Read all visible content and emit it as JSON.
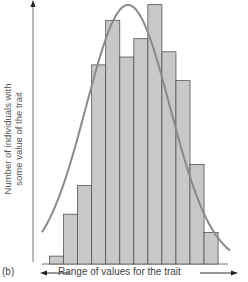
{
  "chart_data": {
    "type": "bar",
    "title": "",
    "panel_label": "(b)",
    "xlabel": "Range of values for the trait",
    "ylabel_line1": "Number of individuals with",
    "ylabel_line2": "some value of the trait",
    "categories": [
      "1",
      "2",
      "3",
      "4",
      "5",
      "6",
      "7",
      "8",
      "9",
      "10",
      "11",
      "12"
    ],
    "values": [
      3,
      19,
      30,
      76,
      93,
      79,
      86,
      99,
      81,
      70,
      38,
      12
    ],
    "ylim": [
      0,
      100
    ],
    "grid": false,
    "legend": null,
    "overlay": "normal distribution curve",
    "colors": {
      "bar_fill": "#c8c8c8",
      "bar_edge": "#555555",
      "curve": "#8a8a8a",
      "axis": "#777777",
      "text": "#444444"
    }
  }
}
